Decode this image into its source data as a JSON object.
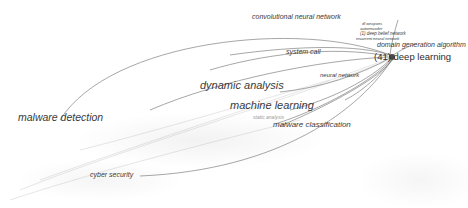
{
  "diagram": {
    "type": "keyword co-occurrence network",
    "focus_node": {
      "label": "(41) deep learning",
      "count": 41
    },
    "nodes": [
      {
        "id": "malware-detection",
        "label": "malware detection"
      },
      {
        "id": "dynamic-analysis",
        "label": "dynamic analysis"
      },
      {
        "id": "machine-learning",
        "label": "machine learning"
      },
      {
        "id": "malware-classification",
        "label": "malware classification"
      },
      {
        "id": "static-analysis",
        "label": "static analysis"
      },
      {
        "id": "cyber-security",
        "label": "cyber security"
      },
      {
        "id": "system-call",
        "label": "system call"
      },
      {
        "id": "neural-network",
        "label": "neural network"
      },
      {
        "id": "convolutional-neural-network",
        "label": "convolutional neural network"
      },
      {
        "id": "domain-generation-algorithm",
        "label": "domain generation algorithm"
      },
      {
        "id": "dl-weapons",
        "label": "dl weapons"
      },
      {
        "id": "autoencoder",
        "label": "autoencoder"
      },
      {
        "id": "deep-belief-network",
        "label": "(1) deep belief network"
      },
      {
        "id": "recurrent-neural-network",
        "label": "recurrent neural network"
      },
      {
        "id": "deep-learning",
        "label": "(41) deep learning"
      }
    ],
    "edge_color": "#6b6b6b",
    "label_color": "#3a3a3a"
  }
}
